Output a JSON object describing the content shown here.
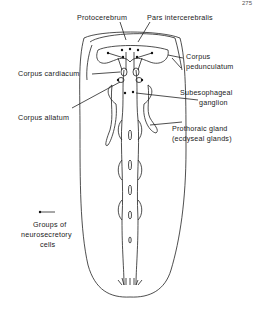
{
  "figure": {
    "corner_text": "275",
    "labels": {
      "protocerebrum": "Protocerebrum",
      "pars_intercerebralis": "Pars intercerebralis",
      "corpus_pedunculatum_1": "Corpus",
      "corpus_pedunculatum_2": "pedunculatum",
      "corpus_cardiacum": "Corpus cardiacum",
      "subesophageal_1": "Subesophageal",
      "subesophageal_2": "ganglion",
      "corpus_allatum": "Corpus allatum",
      "prothoracic_1": "Prothoraic gland",
      "prothoracic_2": "(ecdyseal glands)"
    },
    "legend": {
      "line1": "Groups of",
      "line2": "neurosecretory",
      "line3": "cells"
    }
  }
}
